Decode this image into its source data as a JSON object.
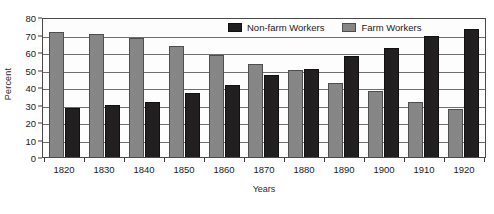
{
  "chart_data": {
    "type": "bar",
    "title": "",
    "xlabel": "Years",
    "ylabel": "Percent",
    "categories": [
      "1820",
      "1830",
      "1840",
      "1850",
      "1860",
      "1870",
      "1880",
      "1890",
      "1900",
      "1910",
      "1920"
    ],
    "series": [
      {
        "name": "Farm Workers",
        "color": "#868686",
        "values": [
          71.5,
          70.5,
          68,
          63.5,
          58.5,
          53,
          49.5,
          42.5,
          38,
          31.5,
          27.5
        ]
      },
      {
        "name": "Non-farm Workers",
        "color": "#211f20",
        "values": [
          28,
          29.5,
          31.5,
          36.5,
          41,
          47,
          50.5,
          57.5,
          62.5,
          69,
          73
        ]
      }
    ],
    "ylim": [
      0,
      80
    ],
    "yticks": [
      0,
      10,
      20,
      30,
      40,
      50,
      60,
      70,
      80
    ],
    "ytick_labels": [
      "0",
      "10",
      "20",
      "30",
      "40",
      "50",
      "60",
      "70",
      "80"
    ],
    "grid": true,
    "grid_axis": "y",
    "legend_position": "top-right-inside",
    "legend_order": [
      "Non-farm Workers",
      "Farm Workers"
    ],
    "bar_order_in_group": [
      "Farm Workers",
      "Non-farm Workers"
    ]
  },
  "legend": {
    "entries": [
      {
        "label": "Non-farm Workers",
        "swatch": "black-swatch-icon"
      },
      {
        "label": "Farm Workers",
        "swatch": "gray-swatch-icon"
      }
    ]
  }
}
